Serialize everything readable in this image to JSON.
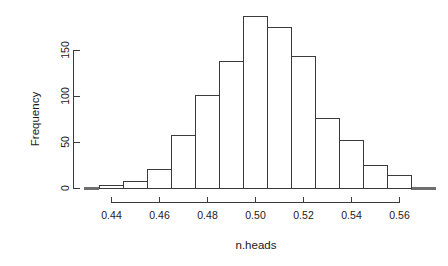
{
  "chart_data": {
    "type": "bar",
    "title": "",
    "subtitle": "",
    "xlabel": "n.heads",
    "ylabel": "Frequency",
    "grid": false,
    "legend": "none",
    "bin_width": 0.01,
    "xlim": [
      0.4325,
      0.5675
    ],
    "ylim": [
      0,
      190
    ],
    "xticks": [
      "0.44",
      "0.46",
      "0.48",
      "0.50",
      "0.52",
      "0.54",
      "0.56"
    ],
    "xtick_values": [
      0.44,
      0.46,
      0.48,
      0.5,
      0.52,
      0.54,
      0.56
    ],
    "yticks": [
      "0",
      "50",
      "100",
      "150"
    ],
    "ytick_values": [
      0,
      50,
      100,
      150
    ],
    "bin_edges": [
      0.435,
      0.445,
      0.455,
      0.465,
      0.475,
      0.485,
      0.495,
      0.505,
      0.515,
      0.525,
      0.535,
      0.545,
      0.555,
      0.565
    ],
    "categories": [
      "0.435-0.445",
      "0.445-0.455",
      "0.455-0.465",
      "0.465-0.475",
      "0.475-0.485",
      "0.485-0.495",
      "0.495-0.505",
      "0.505-0.515",
      "0.515-0.525",
      "0.525-0.535",
      "0.535-0.545",
      "0.545-0.555",
      "0.555-0.565"
    ],
    "values": [
      3,
      8,
      21,
      58,
      101,
      138,
      187,
      175,
      143,
      76,
      52,
      25,
      14
    ]
  },
  "axes": {
    "x_title": "n.heads",
    "y_title": "Frequency"
  }
}
